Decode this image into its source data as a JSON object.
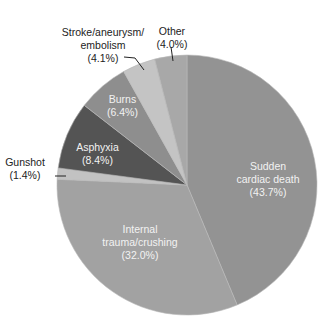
{
  "chart_data": {
    "type": "pie",
    "title": "",
    "start_angle_deg": 0,
    "direction": "clockwise",
    "slices": [
      {
        "label": "Sudden cardiac death",
        "value": 43.7,
        "display": "(43.7%)",
        "color": "#939393"
      },
      {
        "label": "Internal trauma/crushing",
        "value": 32.0,
        "display": "(32.0%)",
        "color": "#a2a2a2"
      },
      {
        "label": "Gunshot",
        "value": 1.4,
        "display": "(1.4%)",
        "color": "#c2c2c2"
      },
      {
        "label": "Asphyxia",
        "value": 8.4,
        "display": "(8.4%)",
        "color": "#545454"
      },
      {
        "label": "Burns",
        "value": 6.4,
        "display": "(6.4%)",
        "color": "#8e8e8e"
      },
      {
        "label": "Stroke/aneurysm/embolism",
        "value": 4.1,
        "display": "(4.1%)",
        "color": "#c4c4c4"
      },
      {
        "label": "Other",
        "value": 4.0,
        "display": "(4.0%)",
        "color": "#a8a8a8"
      }
    ],
    "legend": "none (direct labels)"
  },
  "labels": {
    "sudden": {
      "line1": "Sudden",
      "line2": "cardiac death",
      "pct": "(43.7%)"
    },
    "internal": {
      "line1": "Internal",
      "line2": "trauma/crushing",
      "pct": "(32.0%)"
    },
    "gunshot": {
      "line1": "Gunshot",
      "pct": "(1.4%)"
    },
    "asphyxia": {
      "line1": "Asphyxia",
      "pct": "(8.4%)"
    },
    "burns": {
      "line1": "Burns",
      "pct": "(6.4%)"
    },
    "stroke": {
      "line1": "Stroke/aneurysm/",
      "line2": "embolism",
      "pct": "(4.1%)"
    },
    "other": {
      "line1": "Other",
      "pct": "(4.0%)"
    }
  }
}
